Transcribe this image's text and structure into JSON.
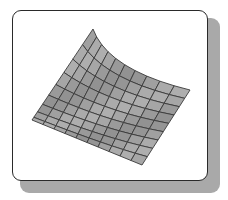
{
  "figure": {
    "colors": {
      "frame_border": "#2a2a2a",
      "frame_fill": "#ffffff",
      "shadow": "#a9a9a9",
      "surface_fill": "#a6a6a6",
      "mesh_line": "#3a3a3a"
    },
    "mesh": {
      "cols": 10,
      "rows": 9,
      "corners": {
        "top_peak": [
          93,
          29
        ],
        "left": [
          32,
          120
        ],
        "bottom": [
          142,
          165
        ],
        "right": [
          190,
          90
        ]
      },
      "back_edge_control": [
        108,
        70
      ]
    }
  }
}
